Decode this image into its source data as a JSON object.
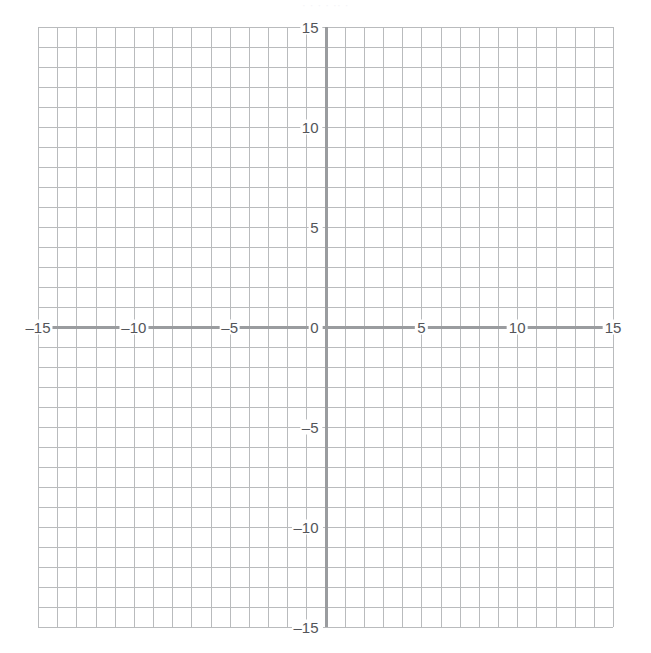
{
  "figure": {
    "title": "",
    "top_clipped_text": "· · ·   ·  ·· ·",
    "background_color": "#ffffff",
    "grid_line_color": "#b9bbbd",
    "axis_line_color": "#9a9c9f",
    "label_color": "#53555a",
    "minus_sign": "–"
  },
  "chart_data": {
    "type": "scatter",
    "title": "",
    "subtitle": "",
    "xlabel": "",
    "ylabel": "",
    "xlim": [
      -15,
      15
    ],
    "ylim": [
      -15,
      15
    ],
    "grid": true,
    "grid_step": 1,
    "major_tick_step": 5,
    "legend": null,
    "legend_position": "none",
    "series": [],
    "annotations": [],
    "x_tick_values": [
      -15,
      -10,
      -5,
      0,
      5,
      10,
      15
    ],
    "y_tick_values": [
      -15,
      -10,
      -5,
      0,
      5,
      10,
      15
    ],
    "x_tick_labels": [
      "–15",
      "–10",
      "–5",
      "0",
      "5",
      "10",
      "15"
    ],
    "y_tick_labels": [
      "–15",
      "–10",
      "–5",
      "0",
      "5",
      "10",
      "15"
    ],
    "axes": {
      "x_axis_at_y": 0,
      "y_axis_at_x": 0,
      "show_x_axis": true,
      "show_y_axis": true
    }
  }
}
